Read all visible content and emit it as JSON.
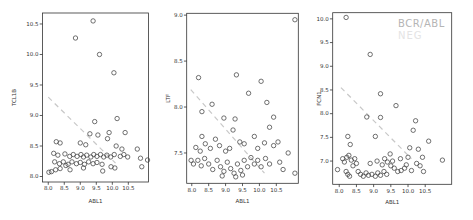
{
  "figure": {
    "background": "#ffffff",
    "axis_color": "#333333",
    "point_color": "#424242",
    "trend_color": "#c8c8c8",
    "tick_label_color": "#333333",
    "watermark": {
      "line1": "BCR/ABL",
      "line2": "NEG",
      "line1_color": "#b5b5b5",
      "line2_color": "#e4e4e4"
    }
  },
  "chart_data": [
    {
      "type": "scatter",
      "title": "",
      "xlabel": "ABL1",
      "ylabel": "TCL1B",
      "xlim": [
        7.82,
        11.13
      ],
      "ylim": [
        7.91,
        10.68
      ],
      "xticks": [
        8.0,
        8.5,
        9.0,
        9.5,
        10.0,
        10.5
      ],
      "yticks": [
        8.0,
        8.5,
        9.0,
        9.5,
        10.0,
        10.5
      ],
      "grid": false,
      "marker": "open-circle",
      "trend_line": {
        "style": "dashed",
        "x1": 8.0,
        "y1": 9.3,
        "x2": 10.1,
        "y2": 8.22
      },
      "points": [
        [
          9.4,
          10.55
        ],
        [
          8.85,
          10.27
        ],
        [
          9.6,
          10.0
        ],
        [
          10.05,
          9.7
        ],
        [
          10.15,
          8.95
        ],
        [
          9.45,
          8.9
        ],
        [
          9.3,
          8.7
        ],
        [
          9.55,
          8.68
        ],
        [
          9.9,
          8.72
        ],
        [
          10.4,
          8.72
        ],
        [
          8.25,
          8.57
        ],
        [
          8.37,
          8.55
        ],
        [
          9.0,
          8.55
        ],
        [
          9.17,
          8.52
        ],
        [
          10.12,
          8.5
        ],
        [
          10.78,
          8.45
        ],
        [
          10.3,
          8.45
        ],
        [
          9.85,
          8.62
        ],
        [
          8.17,
          8.38
        ],
        [
          8.3,
          8.35
        ],
        [
          8.52,
          8.37
        ],
        [
          8.67,
          8.33
        ],
        [
          8.78,
          8.36
        ],
        [
          8.9,
          8.33
        ],
        [
          9.02,
          8.36
        ],
        [
          9.1,
          8.32
        ],
        [
          9.2,
          8.35
        ],
        [
          9.33,
          8.32
        ],
        [
          9.42,
          8.36
        ],
        [
          9.52,
          8.33
        ],
        [
          9.63,
          8.36
        ],
        [
          9.73,
          8.32
        ],
        [
          9.83,
          8.35
        ],
        [
          9.95,
          8.32
        ],
        [
          10.06,
          8.36
        ],
        [
          10.25,
          8.33
        ],
        [
          10.36,
          8.36
        ],
        [
          10.48,
          8.32
        ],
        [
          10.88,
          8.3
        ],
        [
          11.1,
          8.27
        ],
        [
          8.2,
          8.24
        ],
        [
          8.35,
          8.21
        ],
        [
          8.47,
          8.24
        ],
        [
          8.62,
          8.2
        ],
        [
          8.74,
          8.24
        ],
        [
          8.88,
          8.21
        ],
        [
          9.0,
          8.23
        ],
        [
          9.13,
          8.2
        ],
        [
          9.26,
          8.24
        ],
        [
          9.4,
          8.21
        ],
        [
          9.52,
          8.23
        ],
        [
          9.68,
          8.2
        ],
        [
          8.55,
          8.18
        ],
        [
          8.02,
          8.07
        ],
        [
          8.1,
          8.08
        ],
        [
          8.23,
          8.11
        ],
        [
          8.37,
          8.13
        ],
        [
          8.68,
          8.11
        ],
        [
          9.1,
          8.14
        ],
        [
          9.7,
          8.09
        ],
        [
          9.96,
          8.16
        ],
        [
          10.08,
          8.14
        ],
        [
          10.92,
          8.16
        ]
      ]
    },
    {
      "type": "scatter",
      "title": "",
      "xlabel": "ABL1",
      "ylabel": "LTF",
      "xlim": [
        7.85,
        11.15
      ],
      "ylim": [
        7.17,
        9.02
      ],
      "xticks": [
        8.0,
        8.5,
        9.0,
        9.5,
        10.0,
        10.5
      ],
      "yticks": [
        7.5,
        8.0,
        8.5,
        9.0
      ],
      "grid": false,
      "marker": "open-circle",
      "trend_line": {
        "style": "dashed",
        "x1": 7.97,
        "y1": 8.19,
        "x2": 10.15,
        "y2": 7.28
      },
      "points": [
        [
          11.05,
          8.95
        ],
        [
          8.2,
          8.32
        ],
        [
          9.32,
          8.35
        ],
        [
          10.05,
          8.28
        ],
        [
          9.68,
          8.15
        ],
        [
          10.22,
          8.05
        ],
        [
          8.3,
          7.95
        ],
        [
          8.6,
          8.03
        ],
        [
          8.95,
          7.88
        ],
        [
          9.28,
          7.87
        ],
        [
          10.42,
          7.89
        ],
        [
          10.3,
          7.78
        ],
        [
          9.22,
          7.75
        ],
        [
          9.85,
          7.68
        ],
        [
          8.3,
          7.68
        ],
        [
          8.12,
          7.56
        ],
        [
          8.25,
          7.52
        ],
        [
          8.4,
          7.6
        ],
        [
          8.55,
          7.55
        ],
        [
          8.7,
          7.65
        ],
        [
          8.82,
          7.58
        ],
        [
          9.0,
          7.52
        ],
        [
          9.12,
          7.55
        ],
        [
          9.42,
          7.62
        ],
        [
          9.55,
          7.6
        ],
        [
          9.95,
          7.55
        ],
        [
          10.15,
          7.61
        ],
        [
          10.42,
          7.58
        ],
        [
          10.55,
          7.62
        ],
        [
          10.85,
          7.5
        ],
        [
          7.98,
          7.42
        ],
        [
          8.05,
          7.38
        ],
        [
          8.18,
          7.42
        ],
        [
          8.28,
          7.36
        ],
        [
          8.38,
          7.44
        ],
        [
          8.5,
          7.38
        ],
        [
          8.62,
          7.32
        ],
        [
          8.75,
          7.42
        ],
        [
          8.85,
          7.35
        ],
        [
          8.95,
          7.3
        ],
        [
          9.05,
          7.4
        ],
        [
          9.15,
          7.33
        ],
        [
          9.25,
          7.28
        ],
        [
          9.35,
          7.38
        ],
        [
          9.45,
          7.31
        ],
        [
          9.55,
          7.42
        ],
        [
          9.65,
          7.35
        ],
        [
          9.75,
          7.45
        ],
        [
          9.85,
          7.38
        ],
        [
          9.95,
          7.42
        ],
        [
          10.05,
          7.35
        ],
        [
          10.18,
          7.44
        ],
        [
          10.3,
          7.38
        ],
        [
          10.6,
          7.4
        ],
        [
          10.7,
          7.32
        ],
        [
          11.05,
          7.28
        ],
        [
          8.9,
          7.25
        ],
        [
          9.3,
          7.24
        ],
        [
          9.5,
          7.26
        ]
      ]
    },
    {
      "type": "scatter",
      "title": "",
      "xlabel": "ABL1",
      "ylabel": "FCN1",
      "xlim": [
        7.81,
        11.27
      ],
      "ylim": [
        6.51,
        10.13
      ],
      "xticks": [
        8.0,
        8.5,
        9.0,
        9.5,
        10.0,
        10.5
      ],
      "yticks": [
        7.0,
        7.5,
        8.0,
        8.5,
        9.0,
        9.5,
        10.0
      ],
      "grid": false,
      "marker": "open-circle",
      "legend": {
        "position": "top-right",
        "entries": [
          "BCR/ABL",
          "NEG"
        ]
      },
      "trend_line": {
        "style": "dashed",
        "x1": 8.05,
        "y1": 8.55,
        "x2": 10.1,
        "y2": 7.05
      },
      "points": [
        [
          8.2,
          10.03
        ],
        [
          8.9,
          9.25
        ],
        [
          9.2,
          8.42
        ],
        [
          9.65,
          8.17
        ],
        [
          8.8,
          7.93
        ],
        [
          9.2,
          7.92
        ],
        [
          10.22,
          7.85
        ],
        [
          10.15,
          7.65
        ],
        [
          8.25,
          7.52
        ],
        [
          9.05,
          7.52
        ],
        [
          8.32,
          7.35
        ],
        [
          10.6,
          7.42
        ],
        [
          10.3,
          7.25
        ],
        [
          9.48,
          7.15
        ],
        [
          10.05,
          7.28
        ],
        [
          8.1,
          7.05
        ],
        [
          8.15,
          6.98
        ],
        [
          8.22,
          7.08
        ],
        [
          8.28,
          7.12
        ],
        [
          8.35,
          7.02
        ],
        [
          8.45,
          7.05
        ],
        [
          9.1,
          7.0
        ],
        [
          9.32,
          7.05
        ],
        [
          9.4,
          6.98
        ],
        [
          9.55,
          7.0
        ],
        [
          9.78,
          7.05
        ],
        [
          10.0,
          7.08
        ],
        [
          10.42,
          7.08
        ],
        [
          11.0,
          7.02
        ],
        [
          7.95,
          6.82
        ],
        [
          8.2,
          6.78
        ],
        [
          8.25,
          6.72
        ],
        [
          8.3,
          6.68
        ],
        [
          8.4,
          6.9
        ],
        [
          8.5,
          6.95
        ],
        [
          8.55,
          6.78
        ],
        [
          8.62,
          6.72
        ],
        [
          8.7,
          6.68
        ],
        [
          8.78,
          6.75
        ],
        [
          8.85,
          6.7
        ],
        [
          8.9,
          6.95
        ],
        [
          8.95,
          6.72
        ],
        [
          9.05,
          6.68
        ],
        [
          9.12,
          6.75
        ],
        [
          9.2,
          6.7
        ],
        [
          9.25,
          6.92
        ],
        [
          9.3,
          6.78
        ],
        [
          9.38,
          6.72
        ],
        [
          9.5,
          6.9
        ],
        [
          9.6,
          6.85
        ],
        [
          9.7,
          6.78
        ],
        [
          9.8,
          6.8
        ],
        [
          9.9,
          6.85
        ],
        [
          9.95,
          6.92
        ],
        [
          10.1,
          6.8
        ],
        [
          10.25,
          6.95
        ],
        [
          10.35,
          6.9
        ],
        [
          10.45,
          6.78
        ]
      ]
    }
  ]
}
